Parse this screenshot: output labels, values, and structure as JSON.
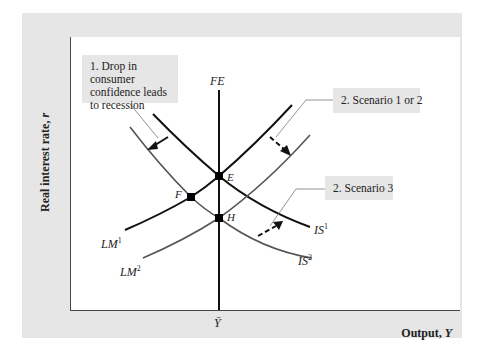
{
  "figure": {
    "y_axis_label": "Real interest rate,",
    "y_axis_var": "r",
    "x_axis_label": "Output,",
    "x_axis_var": "Y",
    "x_tick_label": "Ȳ",
    "curves": {
      "FE": {
        "name": "FE",
        "color": "#111111"
      },
      "LM1": {
        "base": "LM",
        "sup": "1",
        "color": "#111111"
      },
      "LM2": {
        "base": "LM",
        "sup": "2",
        "color": "#555555"
      },
      "IS1": {
        "base": "IS",
        "sup": "1",
        "color": "#111111"
      },
      "IS2": {
        "base": "IS",
        "sup": "2",
        "color": "#555555"
      }
    },
    "points": {
      "E": "E",
      "F": "F",
      "H": "H"
    },
    "annotations": {
      "note1": "1. Drop in consumer\n   confidence leads\n   to recession",
      "note2": "2. Scenario 1 or 2",
      "note3": "2. Scenario 3"
    },
    "colors": {
      "panel_bg": "#e6e6e6",
      "plot_bg": "#ffffff",
      "primary_curve": "#111111",
      "shifted_curve": "#555555",
      "leader_line": "#777777"
    }
  }
}
